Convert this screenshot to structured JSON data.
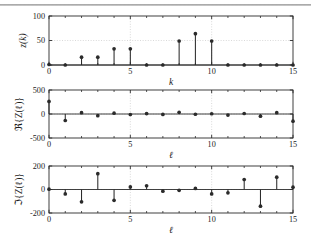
{
  "figure": {
    "background": "#ffffff",
    "line_color": "#2b2b2b",
    "grid_color": "#cfcfcf",
    "top_rule": true
  },
  "chart_data": [
    {
      "type": "scatter",
      "name": "panel-1",
      "plot_style": "stem",
      "title": "",
      "xlabel": "k",
      "ylabel": "z(k)",
      "ylabel_parts": {
        "func": "z",
        "arg": "k"
      },
      "x": [
        0,
        1,
        2,
        3,
        4,
        5,
        6,
        7,
        8,
        9,
        10,
        11,
        12,
        13,
        14,
        15
      ],
      "values": [
        1,
        0,
        16,
        16,
        33,
        33,
        0,
        0,
        49,
        64,
        49,
        0,
        0,
        0,
        0,
        0
      ],
      "xlim": [
        0,
        15
      ],
      "ylim": [
        0,
        100
      ],
      "xticks": [
        0,
        5,
        10,
        15
      ],
      "xticklabels": [
        "0",
        "5",
        "10",
        "15"
      ],
      "yticks": [
        0,
        50,
        100
      ],
      "yticklabels": [
        "0",
        "50",
        "100"
      ],
      "minor_xticks": [
        1,
        2,
        3,
        4,
        6,
        7,
        8,
        9,
        11,
        12,
        13,
        14
      ],
      "grid": true,
      "legend": null
    },
    {
      "type": "scatter",
      "name": "panel-2",
      "plot_style": "stem",
      "title": "",
      "xlabel": "ℓ",
      "ylabel": "ℜ{Z(ℓ)}",
      "ylabel_parts": {
        "func": "ℜ",
        "inner": "Z(ℓ)"
      },
      "x": [
        0,
        1,
        2,
        3,
        4,
        5,
        6,
        7,
        8,
        9,
        10,
        11,
        12,
        13,
        14,
        15
      ],
      "values": [
        262,
        -135,
        28,
        -35,
        18,
        -10,
        8,
        -8,
        35,
        -5,
        5,
        -22,
        10,
        -45,
        28,
        -150
      ],
      "xlim": [
        0,
        15
      ],
      "ylim": [
        -500,
        500
      ],
      "xticks": [
        0,
        5,
        10,
        15
      ],
      "xticklabels": [
        "0",
        "5",
        "10",
        "15"
      ],
      "yticks": [
        -500,
        0,
        500
      ],
      "yticklabels": [
        "-500",
        "0",
        "500"
      ],
      "minor_xticks": [
        1,
        2,
        3,
        4,
        6,
        7,
        8,
        9,
        11,
        12,
        13,
        14
      ],
      "grid": true,
      "legend": null
    },
    {
      "type": "scatter",
      "name": "panel-3",
      "plot_style": "stem",
      "title": "",
      "xlabel": "ℓ",
      "ylabel": "ℑ{Z(ℓ)}",
      "ylabel_parts": {
        "func": "ℑ",
        "inner": "Z(ℓ)"
      },
      "x": [
        0,
        1,
        2,
        3,
        4,
        5,
        6,
        7,
        8,
        9,
        10,
        11,
        12,
        13,
        14,
        15
      ],
      "values": [
        3,
        -38,
        -105,
        135,
        -92,
        22,
        32,
        -14,
        -7,
        9,
        -38,
        -28,
        85,
        -142,
        105,
        20
      ],
      "xlim": [
        0,
        15
      ],
      "ylim": [
        -200,
        200
      ],
      "xticks": [
        0,
        5,
        10,
        15
      ],
      "xticklabels": [
        "0",
        "5",
        "10",
        "15"
      ],
      "yticks": [
        -200,
        0,
        200
      ],
      "yticklabels": [
        "-200",
        "0",
        "200"
      ],
      "minor_xticks": [
        1,
        2,
        3,
        4,
        6,
        7,
        8,
        9,
        11,
        12,
        13,
        14
      ],
      "grid": true,
      "legend": null
    }
  ]
}
